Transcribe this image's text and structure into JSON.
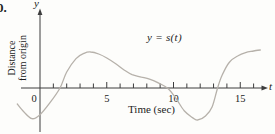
{
  "figure": {
    "problem_number": "0.",
    "y_axis_letter": "y",
    "x_axis_letter": "t",
    "y_axis_label_line1": "Distance",
    "y_axis_label_line2": "from origin",
    "x_axis_label": "Time (sec)",
    "curve_label": "y = s(t)"
  },
  "chart_data": {
    "type": "line",
    "title": "",
    "xlabel": "Time (sec)",
    "ylabel": "Distance from origin",
    "curve_label": "y = s(t)",
    "x_ticks_labeled": [
      0,
      5,
      10,
      15
    ],
    "x_minor_tick_step": 1,
    "x_minor_tick_max": 16,
    "xlim": [
      -1.7,
      16.6
    ],
    "ylim": [
      -2.9,
      3.3
    ],
    "y_units": "unlabeled (arbitrary distance units)",
    "grid": false,
    "legend": "none, curve labeled inline at upper middle of plot",
    "series": [
      {
        "name": "s(t)",
        "x": [
          -1.7,
          -1.2,
          -0.6,
          0,
          0.75,
          1.5,
          2.0,
          2.7,
          3.3,
          3.8,
          4.4,
          5.0,
          5.7,
          6.3,
          6.9,
          7.6,
          8.2,
          8.9,
          9.6,
          10.2,
          10.8,
          11.4,
          11.8,
          12.4,
          12.9,
          13.3,
          13.65,
          14.2,
          14.8,
          15.4,
          16.0,
          16.5
        ],
        "y": [
          -1.2,
          -1.8,
          -2.3,
          -2.0,
          -1.1,
          0.0,
          1.2,
          2.2,
          2.6,
          2.7,
          2.55,
          2.25,
          1.8,
          1.35,
          1.0,
          0.82,
          0.67,
          0.37,
          -0.05,
          -0.8,
          -1.7,
          -2.2,
          -2.4,
          -2.1,
          -1.4,
          0.0,
          0.97,
          1.95,
          2.4,
          2.65,
          2.77,
          2.85
        ]
      }
    ],
    "features": {
      "zero_crossings_t": [
        1.5,
        9.6,
        13.3
      ],
      "local_max": [
        {
          "t": 3.8,
          "s": 2.7
        },
        {
          "t": 16.5,
          "s": 2.85
        }
      ],
      "local_min": [
        {
          "t": -0.6,
          "s": -2.3
        },
        {
          "t": 11.8,
          "s": -2.4
        }
      ]
    },
    "colors": {
      "curve": "#b6b1aa",
      "axis": "#3d3d3d",
      "text": "#1c1c1c",
      "background": "#fdfdfb"
    }
  }
}
